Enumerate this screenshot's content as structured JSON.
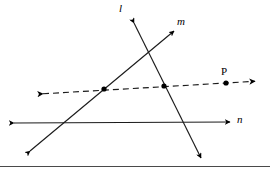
{
  "figure": {
    "width": 270,
    "height": 171,
    "background_color": "#ffffff",
    "stroke_color": "#000000",
    "rule_color": "#4a4a4a"
  },
  "labels": {
    "line_l": "l",
    "line_m": "m",
    "line_n": "n",
    "point_p": "P"
  },
  "lines": [
    {
      "name": "line-l",
      "label": "l",
      "style": "solid",
      "arrows": "both",
      "x1": 133,
      "y1": 20,
      "x2": 202,
      "y2": 160
    },
    {
      "name": "line-m",
      "label": "m",
      "style": "solid",
      "arrows": "both",
      "x1": 176,
      "y1": 29,
      "x2": 28,
      "y2": 153
    },
    {
      "name": "line-n",
      "label": "n",
      "style": "solid",
      "arrows": "both",
      "x1": 12,
      "y1": 123,
      "x2": 232,
      "y2": 122
    },
    {
      "name": "dashed-transversal",
      "label": "",
      "style": "dashed",
      "arrows": "both",
      "x1": 40,
      "y1": 94,
      "x2": 258,
      "y2": 81
    }
  ],
  "points": [
    {
      "name": "intersection-m-dashed",
      "label": "",
      "x": 104,
      "y": 89
    },
    {
      "name": "intersection-l-dashed",
      "label": "",
      "x": 164,
      "y": 86
    },
    {
      "name": "point-p",
      "label": "P",
      "x": 226,
      "y": 83
    }
  ]
}
